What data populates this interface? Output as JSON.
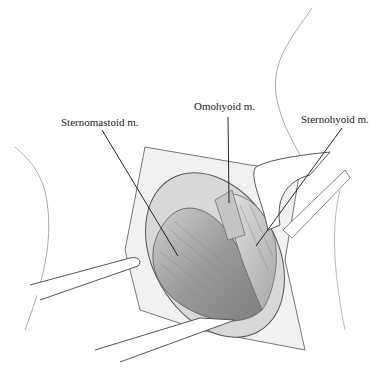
{
  "figure": {
    "labels": [
      {
        "text": "Sternomastoid m.",
        "x": 61,
        "y": 116
      },
      {
        "text": "Omohyoid m.",
        "x": 194,
        "y": 100
      },
      {
        "text": "Sternohyoid m.",
        "x": 301,
        "y": 113
      }
    ]
  }
}
